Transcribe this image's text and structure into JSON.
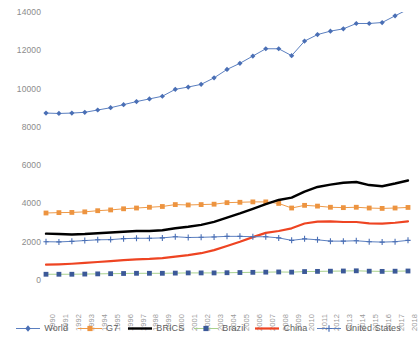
{
  "chart_data": {
    "type": "line",
    "title": "",
    "subtitle": "",
    "xlabel": "",
    "ylabel": "",
    "ylim": [
      0,
      14000
    ],
    "ytick_step": 2000,
    "yticks": [
      "0",
      "2000",
      "4000",
      "6000",
      "8000",
      "10000",
      "12000",
      "14000"
    ],
    "grid": false,
    "legend_position": "bottom",
    "categories": [
      "1990",
      "1991",
      "1992",
      "1993",
      "1994",
      "1995",
      "1996",
      "1997",
      "1998",
      "1999",
      "2000",
      "2001",
      "2002",
      "2003",
      "2004",
      "2005",
      "2006",
      "2007",
      "2008",
      "2009",
      "2010",
      "2011",
      "2012",
      "2013",
      "2014",
      "2015",
      "2016",
      "2017",
      "2018"
    ],
    "series": [
      {
        "name": "World",
        "color": "#5B7FC0",
        "marker": "diamond",
        "marker_color": "#4A6FB5",
        "line_width": 1,
        "values": [
          8720,
          8700,
          8720,
          8760,
          8880,
          9000,
          9160,
          9320,
          9460,
          9600,
          9960,
          10080,
          10220,
          10560,
          11000,
          11320,
          11700,
          12080,
          12080,
          11720,
          12480,
          12820,
          13000,
          13120,
          13400,
          13400,
          13450,
          13800,
          14140
        ]
      },
      {
        "name": "G7",
        "color": "#EE9A49",
        "marker": "square",
        "marker_color": "#ED9440",
        "line_width": 1,
        "values": [
          3500,
          3520,
          3530,
          3560,
          3620,
          3660,
          3720,
          3760,
          3800,
          3840,
          3940,
          3920,
          3940,
          3960,
          4040,
          4060,
          4080,
          4080,
          4000,
          3760,
          3900,
          3860,
          3800,
          3780,
          3800,
          3760,
          3740,
          3760,
          3790
        ]
      },
      {
        "name": "BRICS",
        "color": "#000000",
        "marker": "none",
        "marker_color": "#000000",
        "line_width": 2.4,
        "values": [
          2420,
          2400,
          2380,
          2400,
          2440,
          2480,
          2520,
          2560,
          2560,
          2600,
          2700,
          2780,
          2880,
          3040,
          3260,
          3480,
          3720,
          3960,
          4180,
          4300,
          4620,
          4860,
          4980,
          5080,
          5120,
          4960,
          4900,
          5040,
          5200
        ]
      },
      {
        "name": "Brazil",
        "color": "#A9D18E",
        "marker": "square",
        "marker_color": "#3B5998",
        "line_width": 1,
        "values": [
          300,
          300,
          300,
          310,
          320,
          330,
          340,
          350,
          350,
          350,
          360,
          370,
          370,
          370,
          380,
          390,
          400,
          410,
          420,
          410,
          440,
          450,
          460,
          470,
          480,
          460,
          450,
          460,
          470
        ]
      },
      {
        "name": "China",
        "color": "#EE4422",
        "marker": "none",
        "marker_color": "#EE4422",
        "line_width": 2.2,
        "values": [
          800,
          820,
          850,
          890,
          940,
          990,
          1040,
          1080,
          1100,
          1140,
          1220,
          1300,
          1400,
          1560,
          1780,
          2000,
          2240,
          2460,
          2560,
          2700,
          2950,
          3050,
          3060,
          3030,
          3030,
          2960,
          2950,
          2990,
          3060
        ]
      },
      {
        "name": "United States",
        "color": "#5B7FC0",
        "marker": "plus",
        "marker_color": "#4A6FB5",
        "line_width": 1,
        "values": [
          2000,
          1990,
          2020,
          2060,
          2100,
          2110,
          2160,
          2180,
          2180,
          2200,
          2260,
          2220,
          2230,
          2250,
          2280,
          2280,
          2260,
          2260,
          2200,
          2070,
          2150,
          2100,
          2030,
          2030,
          2050,
          2000,
          1980,
          2000,
          2070
        ]
      }
    ]
  },
  "legend": {
    "items": [
      {
        "label": "World"
      },
      {
        "label": "G7"
      },
      {
        "label": "BRICS"
      },
      {
        "label": "Brazil"
      },
      {
        "label": "China"
      },
      {
        "label": "United States"
      }
    ]
  }
}
